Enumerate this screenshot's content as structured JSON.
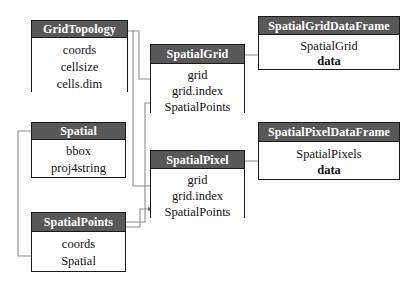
{
  "diagram": {
    "background_color": "#ffffff",
    "header_color": "#585858",
    "header_text_color": "#ffffff",
    "border_color": "#1a1a1a",
    "connector_color": "#888888",
    "arrow_color": "#555555"
  },
  "classes": [
    {
      "id": "gridtopology",
      "name": "GridTopology",
      "attributes": [
        "coords",
        "cellsize",
        "cells.dim"
      ],
      "bold_attributes": []
    },
    {
      "id": "spatial",
      "name": "Spatial",
      "attributes": [
        "bbox",
        "proj4string"
      ],
      "bold_attributes": []
    },
    {
      "id": "spatialpoints",
      "name": "SpatialPoints",
      "attributes": [
        "coords",
        "Spatial"
      ],
      "bold_attributes": []
    },
    {
      "id": "spatialgrid",
      "name": "SpatialGrid",
      "attributes": [
        "grid",
        "grid.index",
        "SpatialPoints"
      ],
      "bold_attributes": []
    },
    {
      "id": "spatialpixel",
      "name": "SpatialPixel",
      "attributes": [
        "grid",
        "grid.index",
        "SpatialPoints"
      ],
      "bold_attributes": []
    },
    {
      "id": "spatialgriddataframe",
      "name": "SpatialGridDataFrame",
      "attributes": [
        "SpatialGrid",
        "data"
      ],
      "bold_attributes": [
        "data"
      ]
    },
    {
      "id": "spatialpixeldataframe",
      "name": "SpatialPixelDataFrame",
      "attributes": [
        "SpatialPixels",
        "data"
      ],
      "bold_attributes": [
        "data"
      ]
    }
  ],
  "connections": [
    {
      "from": "GridTopology",
      "to": "SpatialGrid.grid"
    },
    {
      "from": "GridTopology",
      "to": "SpatialPixel.grid"
    },
    {
      "from": "Spatial",
      "to": "SpatialPoints.Spatial"
    },
    {
      "from": "SpatialPoints",
      "to": "SpatialGrid.SpatialPoints"
    },
    {
      "from": "SpatialPoints",
      "to": "SpatialPixel.SpatialPoints"
    },
    {
      "from": "SpatialGrid",
      "to": "SpatialGridDataFrame.SpatialGrid"
    },
    {
      "from": "SpatialPixel",
      "to": "SpatialPixelDataFrame.SpatialPixels"
    }
  ]
}
